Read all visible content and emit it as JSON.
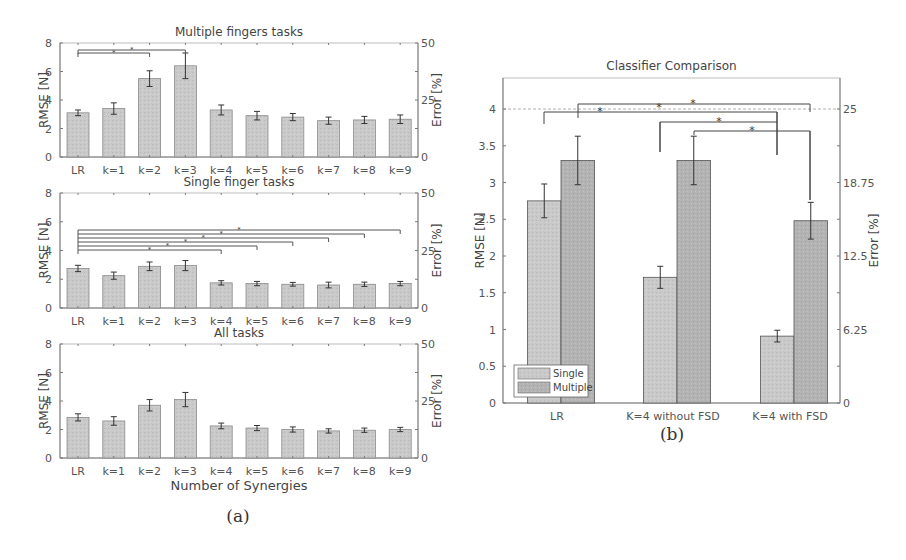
{
  "figure": {
    "caption_a": "(a)",
    "caption_b": "(b)"
  },
  "chart_data": [
    {
      "type": "bar",
      "title": "Multiple fingers tasks",
      "xlabel": "",
      "ylabel": "RMSE [N]",
      "ylabel_right": "Error [%]",
      "ylim": [
        0,
        8
      ],
      "yticks": [
        0,
        2,
        4,
        6,
        8
      ],
      "yticks_right": [
        0,
        25,
        50
      ],
      "categories": [
        "LR",
        "k=1",
        "k=2",
        "k=3",
        "k=4",
        "k=5",
        "k=6",
        "k=7",
        "k=8",
        "k=9"
      ],
      "values": [
        3.1,
        3.4,
        5.5,
        6.4,
        3.3,
        2.9,
        2.8,
        2.55,
        2.6,
        2.65
      ],
      "errors": [
        0.2,
        0.4,
        0.55,
        0.9,
        0.35,
        0.3,
        0.25,
        0.25,
        0.25,
        0.3
      ],
      "significance": [
        {
          "from": "LR",
          "to": "k=2",
          "label": "*"
        },
        {
          "from": "LR",
          "to": "k=3",
          "label": "*"
        }
      ]
    },
    {
      "type": "bar",
      "title": "Single finger tasks",
      "xlabel": "",
      "ylabel": "RMSE [N]",
      "ylabel_right": "Error [%]",
      "ylim": [
        0,
        8
      ],
      "yticks": [
        0,
        2,
        4,
        6,
        8
      ],
      "yticks_right": [
        0,
        25,
        50
      ],
      "categories": [
        "LR",
        "k=1",
        "k=2",
        "k=3",
        "k=4",
        "k=5",
        "k=6",
        "k=7",
        "k=8",
        "k=9"
      ],
      "values": [
        2.75,
        2.25,
        2.9,
        2.95,
        1.75,
        1.7,
        1.65,
        1.6,
        1.65,
        1.7
      ],
      "errors": [
        0.22,
        0.25,
        0.3,
        0.35,
        0.15,
        0.15,
        0.13,
        0.2,
        0.15,
        0.15
      ],
      "significance": [
        {
          "from": "LR",
          "to": "k=4",
          "label": "*"
        },
        {
          "from": "LR",
          "to": "k=5",
          "label": "*"
        },
        {
          "from": "LR",
          "to": "k=6",
          "label": "*"
        },
        {
          "from": "LR",
          "to": "k=7",
          "label": "*"
        },
        {
          "from": "LR",
          "to": "k=8",
          "label": "*"
        },
        {
          "from": "LR",
          "to": "k=9",
          "label": "*"
        }
      ]
    },
    {
      "type": "bar",
      "title": "All tasks",
      "xlabel": "Number of Synergies",
      "ylabel": "RMSE [N]",
      "ylabel_right": "Error [%]",
      "ylim": [
        0,
        8
      ],
      "yticks": [
        0,
        2,
        4,
        6,
        8
      ],
      "yticks_right": [
        0,
        25,
        50
      ],
      "categories": [
        "LR",
        "k=1",
        "k=2",
        "k=3",
        "k=4",
        "k=5",
        "k=6",
        "k=7",
        "k=8",
        "k=9"
      ],
      "values": [
        2.85,
        2.6,
        3.7,
        4.1,
        2.25,
        2.1,
        2.0,
        1.9,
        1.95,
        2.0
      ],
      "errors": [
        0.25,
        0.3,
        0.4,
        0.5,
        0.2,
        0.18,
        0.18,
        0.15,
        0.15,
        0.15
      ]
    },
    {
      "type": "bar",
      "title": "Classifier Comparison",
      "xlabel": "",
      "ylabel": "RMSE [N]",
      "ylabel_right": "Error [%]",
      "ylim": [
        0,
        4.4
      ],
      "yticks": [
        0,
        0.5,
        1,
        1.5,
        2,
        2.5,
        3,
        3.5,
        4
      ],
      "yticks_right": [
        0,
        6.25,
        12.5,
        18.75,
        25
      ],
      "categories": [
        "LR",
        "K=4 without FSD",
        "K=4 with FSD"
      ],
      "series": [
        {
          "name": "Single",
          "values": [
            2.75,
            1.71,
            0.91
          ],
          "errors": [
            0.23,
            0.15,
            0.08
          ]
        },
        {
          "name": "Multiple",
          "values": [
            3.3,
            3.3,
            2.48
          ],
          "errors": [
            0.33,
            0.33,
            0.25
          ]
        }
      ],
      "legend": {
        "position": "lower-left",
        "entries": [
          "Single",
          "Multiple"
        ]
      },
      "reference_line": 4,
      "significance": [
        {
          "from": "LR Multiple",
          "to": "K=4 with FSD Multiple",
          "label": "*"
        },
        {
          "from": "LR Single",
          "to": "K=4 without FSD Multiple",
          "label": "*"
        },
        {
          "from": "K=4 without FSD Single",
          "to": "K=4 with FSD Single",
          "label": "*"
        },
        {
          "from": "K=4 without FSD Multiple",
          "to": "K=4 with FSD Multiple",
          "label": "*"
        }
      ]
    }
  ]
}
